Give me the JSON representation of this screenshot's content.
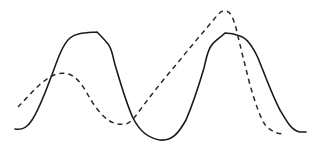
{
  "diagram": {
    "type": "waveform-comparison",
    "background": "#ffffff",
    "curves": [
      {
        "name": "solid",
        "style": "solid",
        "color": "#1a1a1a",
        "path": "M15,129 C22,130 27,128 32,120 C40,108 46,90 53,72 C58,58 63,44 70,38 C76,33 84,33 97,32 C100,35 104,39 108,44 C113,50 113,60 116,68 C121,85 127,105 133,118 C138,128 146,138 160,140 C172,141 178,134 186,120 C192,106 199,85 204,68 C206,60 207,52 211,46 C215,40 220,38 225,33 C230,33 235,34 240,36 C247,38 252,45 258,58 C265,75 272,95 280,110 C287,122 292,131 300,132 L306,132"
      },
      {
        "name": "dashed",
        "style": "dashed",
        "color": "#2a2a2a",
        "path": "M18,107 C28,97 38,84 50,77 C55,74 62,72 68,74 C76,76 82,84 88,95 C93,104 100,114 108,120 C114,124 120,125 126,124 C132,122 137,114 143,106 C155,90 168,74 180,60 C192,45 205,30 215,18 C219,13 222,10 226,11 C231,12 233,18 236,28 C240,45 245,65 250,85 C255,102 260,118 266,126 C272,132 278,134 285,134"
      }
    ],
    "observations": {
      "solid_peaks": [
        [
          85,
          32
        ],
        [
          232,
          34
        ]
      ],
      "solid_minimum": [
        160,
        140
      ],
      "dashed_peaks": [
        [
          62,
          73
        ],
        [
          224,
          10
        ]
      ],
      "dashed_minimum": [
        122,
        124
      ]
    }
  }
}
